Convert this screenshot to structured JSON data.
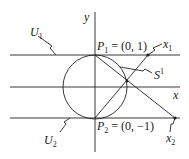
{
  "diagram": {
    "type": "stereographic-projection-charts",
    "axes": {
      "x_label": "x",
      "y_label": "y"
    },
    "labels": {
      "U1": "U",
      "U1_sub": "1",
      "U2": "U",
      "U2_sub": "2",
      "P1": "P",
      "P1_sub": "1",
      "P1_eq": " = (0, 1)",
      "P2": "P",
      "P2_sub": "2",
      "P2_eq": " = (0, −1)",
      "x1": "x",
      "x1_sub": "1",
      "x2": "x",
      "x2_sub": "2",
      "S": "S",
      "S_sup": "1"
    },
    "elements": [
      "unit circle S^1",
      "horizontal line U1 tangent at top P1",
      "horizontal line U2 tangent at bottom P2",
      "x-axis",
      "y-axis",
      "line from P1 through circle point to x2",
      "line from P2 through circle point to x1"
    ],
    "colors": {
      "stroke": "#222222",
      "background": "#ffffff"
    }
  }
}
